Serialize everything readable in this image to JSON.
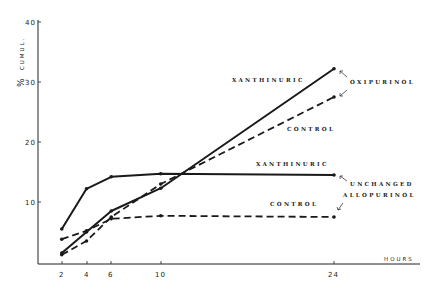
{
  "chart_data": {
    "type": "line",
    "title": "",
    "xlabel": "HOURS",
    "ylabel": "% CUMUL.",
    "x_ticks": [
      2,
      4,
      6,
      10,
      24
    ],
    "y_ticks": [
      10,
      20,
      30,
      40
    ],
    "xlim": [
      0,
      28
    ],
    "ylim": [
      0,
      40
    ],
    "grid": false,
    "x": [
      2,
      4,
      6,
      10,
      24
    ],
    "series": [
      {
        "name": "Xanthinuric Oxipurinol",
        "style": "solid",
        "values": [
          1.5,
          5.0,
          8.5,
          12.3,
          32.2
        ]
      },
      {
        "name": "Control Oxipurinol",
        "style": "dashed",
        "values": [
          1.2,
          3.5,
          7.5,
          13.0,
          27.5
        ]
      },
      {
        "name": "Xanthinuric Unchanged Allopurinol",
        "style": "solid",
        "values": [
          5.5,
          12.2,
          14.2,
          14.7,
          14.5
        ]
      },
      {
        "name": "Control Unchanged Allopurinol",
        "style": "dashed",
        "values": [
          3.8,
          5.2,
          7.2,
          7.7,
          7.5
        ]
      }
    ],
    "annotations": [
      {
        "text": "XANTHINURIC",
        "x": 232,
        "y": 82
      },
      {
        "text": "OXIPURINOL",
        "x": 350,
        "y": 84
      },
      {
        "text": "CONTROL",
        "x": 287,
        "y": 131
      },
      {
        "text": "XANTHINURIC",
        "x": 256,
        "y": 166
      },
      {
        "text": "UNCHANGED",
        "x": 350,
        "y": 186
      },
      {
        "text": "ALLOPURINOL",
        "x": 343,
        "y": 197
      },
      {
        "text": "CONTROL",
        "x": 270,
        "y": 206
      }
    ]
  },
  "axis": {
    "ylabel_symbol": "%",
    "ylabel_text": "CUMUL.",
    "xlabel": "HOURS",
    "y_tick_labels": [
      "10",
      "20",
      "30",
      "40"
    ],
    "x_tick_labels": [
      "2",
      "4",
      "6",
      "10",
      "24"
    ]
  },
  "labels": {
    "xanthinuric_oxi": "XANTHINURIC",
    "oxipurinol": "OXIPURINOL",
    "control_oxi": "CONTROL",
    "xanthinuric_unch": "XANTHINURIC",
    "unchanged": "UNCHANGED",
    "allopurinol": "ALLOPURINOL",
    "control_unch": "CONTROL"
  },
  "colors": {
    "ink": "#1a1a1a",
    "background": "#ffffff"
  }
}
